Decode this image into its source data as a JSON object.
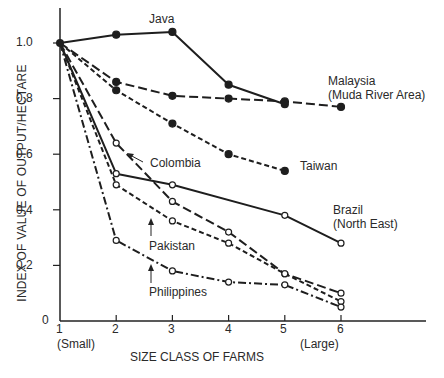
{
  "chart_data": {
    "type": "line",
    "title": "",
    "xlabel": "SIZE CLASS OF FARMS",
    "ylabel": "INDEX OF VALUE OF OUTPUT/HECTARE",
    "x": [
      1,
      2,
      3,
      4,
      5,
      6
    ],
    "x_tick_labels": [
      "1",
      "2",
      "3",
      "4",
      "5",
      "6"
    ],
    "x_tick_sublabels": {
      "1": "(Small)",
      "6": "(Large)"
    },
    "y_ticks": [
      "0",
      "0.2",
      "0.4",
      "0.6",
      "0.8",
      "1.0"
    ],
    "ylim": [
      0,
      1.1
    ],
    "grid": false,
    "legend": "inline labels",
    "series": [
      {
        "name": "Java",
        "label_lines": [
          "Java"
        ],
        "style": "solid",
        "marker": "filled",
        "x": [
          1,
          2,
          3,
          4,
          5
        ],
        "values": [
          1.0,
          1.03,
          1.04,
          0.85,
          0.78
        ]
      },
      {
        "name": "Malaysia (Muda River Area)",
        "label_lines": [
          "Malaysia",
          "(Muda River Area)"
        ],
        "style": "long-dash",
        "marker": "filled",
        "x": [
          1,
          2,
          3,
          4,
          5,
          6
        ],
        "values": [
          1.0,
          0.86,
          0.81,
          0.8,
          0.79,
          0.77
        ]
      },
      {
        "name": "Taiwan",
        "label_lines": [
          "Taiwan"
        ],
        "style": "short-dash",
        "marker": "filled",
        "x": [
          1,
          2,
          3,
          4,
          5
        ],
        "values": [
          1.0,
          0.83,
          0.71,
          0.6,
          0.54
        ]
      },
      {
        "name": "Colombia",
        "label_lines": [
          "Colombia"
        ],
        "style": "long-dash",
        "marker": "open",
        "x": [
          1,
          2,
          3,
          4,
          5,
          6
        ],
        "values": [
          1.0,
          0.64,
          0.43,
          0.32,
          0.17,
          0.1
        ]
      },
      {
        "name": "Brazil (North East)",
        "label_lines": [
          "Brazil",
          "(North East)"
        ],
        "style": "solid",
        "marker": "open",
        "x": [
          1,
          2,
          3,
          5,
          6
        ],
        "values": [
          1.0,
          0.53,
          0.49,
          0.38,
          0.28
        ]
      },
      {
        "name": "Pakistan",
        "label_lines": [
          "Pakistan"
        ],
        "style": "short-dash",
        "marker": "open",
        "x": [
          1,
          2,
          3,
          4,
          5,
          6
        ],
        "values": [
          1.0,
          0.49,
          0.36,
          0.28,
          0.17,
          0.07
        ]
      },
      {
        "name": "Philippines",
        "label_lines": [
          "Philippines"
        ],
        "style": "dash-dot",
        "marker": "open",
        "x": [
          1,
          2,
          3,
          4,
          5,
          6
        ],
        "values": [
          1.0,
          0.29,
          0.18,
          0.14,
          0.13,
          0.05
        ]
      }
    ]
  },
  "labels": {
    "java": "Java",
    "malaysia_1": "Malaysia",
    "malaysia_2": "(Muda River Area)",
    "taiwan": "Taiwan",
    "colombia": "Colombia",
    "brazil_1": "Brazil",
    "brazil_2": "(North East)",
    "pakistan": "Pakistan",
    "philippines": "Philippines"
  }
}
